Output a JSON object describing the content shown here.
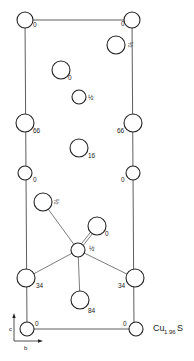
{
  "diagram": {
    "formula": {
      "base": "Cu",
      "subscript": "1.96",
      "suffix": "S"
    },
    "axes": {
      "vertical": "c",
      "horizontal": "b"
    },
    "cell": {
      "x1": 25,
      "y1": 20,
      "x2": 134,
      "y2": 329
    },
    "atoms": [
      {
        "id": "a1",
        "cx": 25,
        "cy": 20,
        "r": 8,
        "label": "0",
        "lx": 33,
        "ly": 27
      },
      {
        "id": "a2",
        "cx": 132,
        "cy": 20,
        "r": 8,
        "label": "0",
        "lx": 121,
        "ly": 26
      },
      {
        "id": "a3",
        "cx": 116,
        "cy": 45,
        "r": 9,
        "label": "½",
        "lx": 128,
        "ly": 42,
        "rotated": true
      },
      {
        "id": "a4",
        "cx": 61,
        "cy": 70,
        "r": 9,
        "label": "0",
        "lx": 68,
        "ly": 80
      },
      {
        "id": "a5",
        "cx": 79,
        "cy": 97,
        "r": 7,
        "label": "½",
        "lx": 88,
        "ly": 100
      },
      {
        "id": "a6",
        "cx": 25,
        "cy": 123,
        "r": 9,
        "label": "66",
        "lx": 33,
        "ly": 133
      },
      {
        "id": "a7",
        "cx": 133,
        "cy": 123,
        "r": 9,
        "label": "66",
        "lx": 117,
        "ly": 133
      },
      {
        "id": "a8",
        "cx": 79,
        "cy": 148,
        "r": 9,
        "label": "16",
        "lx": 88,
        "ly": 158
      },
      {
        "id": "a9",
        "cx": 25,
        "cy": 173,
        "r": 7,
        "label": "0",
        "lx": 33,
        "ly": 182
      },
      {
        "id": "a10",
        "cx": 133,
        "cy": 173,
        "r": 7,
        "label": "0",
        "lx": 121,
        "ly": 182
      },
      {
        "id": "a11",
        "cx": 43,
        "cy": 202,
        "r": 9,
        "label": "½",
        "lx": 54,
        "ly": 199,
        "rotated": true
      },
      {
        "id": "a12",
        "cx": 97,
        "cy": 226,
        "r": 9,
        "label": "0",
        "lx": 105,
        "ly": 236
      },
      {
        "id": "a13",
        "cx": 78,
        "cy": 250,
        "r": 7,
        "label": "½",
        "lx": 89,
        "ly": 251
      },
      {
        "id": "a14",
        "cx": 26,
        "cy": 278,
        "r": 9,
        "label": "34",
        "lx": 36,
        "ly": 288
      },
      {
        "id": "a15",
        "cx": 135,
        "cy": 278,
        "r": 9,
        "label": "34",
        "lx": 118,
        "ly": 288
      },
      {
        "id": "a16",
        "cx": 80,
        "cy": 300,
        "r": 9,
        "label": "84",
        "lx": 88,
        "ly": 313
      },
      {
        "id": "a17",
        "cx": 27,
        "cy": 329,
        "r": 7,
        "label": "0",
        "lx": 35,
        "ly": 326
      },
      {
        "id": "a18",
        "cx": 136,
        "cy": 329,
        "r": 7,
        "label": "0",
        "lx": 123,
        "ly": 326
      }
    ],
    "bonds": [
      {
        "from": "a13",
        "to": "a11"
      },
      {
        "from": "a13",
        "to": "a14"
      },
      {
        "from": "a13",
        "to": "a15"
      },
      {
        "from": "a13",
        "to": "a16"
      },
      {
        "from": "a13",
        "to": "a12",
        "double": true
      }
    ]
  }
}
